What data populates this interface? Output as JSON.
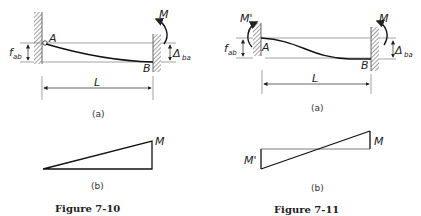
{
  "figures": [
    {
      "caption": "Figure 7-10",
      "part_a": {
        "label": "(a)",
        "point_a": "A",
        "point_b": "B",
        "moment_right": "M",
        "rotation_label": "f",
        "rotation_sub": "ab",
        "deflection_label": "Δ",
        "deflection_sub": "ba",
        "span_label": "L"
      },
      "part_b": {
        "label": "(b)",
        "moment_right": "M"
      }
    },
    {
      "caption": "Figure 7-11",
      "part_a": {
        "label": "(a)",
        "point_a": "A",
        "point_b": "B",
        "moment_left": "M'",
        "moment_right": "M",
        "rotation_label": "f",
        "rotation_sub": "ab",
        "deflection_label": "Δ",
        "deflection_sub": "ba",
        "span_label": "L"
      },
      "part_b": {
        "label": "(b)",
        "moment_left": "M'",
        "moment_right": "M"
      }
    }
  ]
}
